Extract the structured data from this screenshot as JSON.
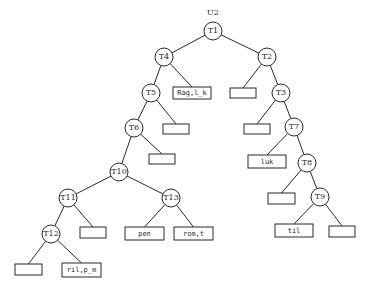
{
  "diagram": {
    "title": "U2",
    "root_label_pos": {
      "x": 213,
      "y": 8
    },
    "node_radius": 9,
    "nodes": [
      {
        "id": "T1",
        "label": "T1",
        "x": 213,
        "y": 31
      },
      {
        "id": "T4",
        "label": "T4",
        "x": 164,
        "y": 57
      },
      {
        "id": "T2",
        "label": "T2",
        "x": 267,
        "y": 57
      },
      {
        "id": "T5",
        "label": "T5",
        "x": 151,
        "y": 93
      },
      {
        "id": "T3",
        "label": "T3",
        "x": 281,
        "y": 93
      },
      {
        "id": "T6",
        "label": "T6",
        "x": 134,
        "y": 128
      },
      {
        "id": "T7",
        "label": "T7",
        "x": 294,
        "y": 127
      },
      {
        "id": "T10",
        "label": "T10",
        "x": 119,
        "y": 172
      },
      {
        "id": "T8",
        "label": "T8",
        "x": 307,
        "y": 163
      },
      {
        "id": "T11",
        "label": "T11",
        "x": 68,
        "y": 198
      },
      {
        "id": "T13",
        "label": "T13",
        "x": 171,
        "y": 198
      },
      {
        "id": "T9",
        "label": "T9",
        "x": 320,
        "y": 197
      },
      {
        "id": "T12",
        "label": "T12",
        "x": 51,
        "y": 234
      }
    ],
    "leaves": [
      {
        "id": "L_T4",
        "label": "Rag,l_k",
        "x": 173,
        "y": 87,
        "w": 38,
        "h": 12
      },
      {
        "id": "L_T2",
        "label": "",
        "x": 230,
        "y": 88,
        "w": 26,
        "h": 10
      },
      {
        "id": "L_T5",
        "label": "",
        "x": 163,
        "y": 124,
        "w": 26,
        "h": 10
      },
      {
        "id": "L_T3",
        "label": "",
        "x": 244,
        "y": 124,
        "w": 26,
        "h": 10
      },
      {
        "id": "L_T6",
        "label": "",
        "x": 149,
        "y": 154,
        "w": 26,
        "h": 10
      },
      {
        "id": "L_T7",
        "label": "luk",
        "x": 248,
        "y": 155,
        "w": 38,
        "h": 13
      },
      {
        "id": "L_T8",
        "label": "",
        "x": 268,
        "y": 193,
        "w": 27,
        "h": 11
      },
      {
        "id": "L_T11",
        "label": "",
        "x": 80,
        "y": 227,
        "w": 26,
        "h": 11
      },
      {
        "id": "L_T13a",
        "label": "pen",
        "x": 125,
        "y": 227,
        "w": 39,
        "h": 13
      },
      {
        "id": "L_T13b",
        "label": "rom,t",
        "x": 174,
        "y": 227,
        "w": 39,
        "h": 13
      },
      {
        "id": "L_T9a",
        "label": "til",
        "x": 275,
        "y": 224,
        "w": 38,
        "h": 13
      },
      {
        "id": "L_T9b",
        "label": "",
        "x": 329,
        "y": 226,
        "w": 26,
        "h": 11
      },
      {
        "id": "L_T12a",
        "label": "",
        "x": 15,
        "y": 264,
        "w": 27,
        "h": 11
      },
      {
        "id": "L_T12b",
        "label": "ril,p_m",
        "x": 62,
        "y": 263,
        "w": 39,
        "h": 14
      }
    ],
    "edges": [
      {
        "from": "T1",
        "to": "T4"
      },
      {
        "from": "T1",
        "to": "T2"
      },
      {
        "from": "T4",
        "to": "T5"
      },
      {
        "from": "T4",
        "to": "L_T4"
      },
      {
        "from": "T2",
        "to": "L_T2"
      },
      {
        "from": "T2",
        "to": "T3"
      },
      {
        "from": "T5",
        "to": "T6"
      },
      {
        "from": "T5",
        "to": "L_T5"
      },
      {
        "from": "T3",
        "to": "L_T3"
      },
      {
        "from": "T3",
        "to": "T7"
      },
      {
        "from": "T6",
        "to": "T10"
      },
      {
        "from": "T6",
        "to": "L_T6"
      },
      {
        "from": "T7",
        "to": "L_T7"
      },
      {
        "from": "T7",
        "to": "T8"
      },
      {
        "from": "T10",
        "to": "T11"
      },
      {
        "from": "T10",
        "to": "T13"
      },
      {
        "from": "T8",
        "to": "L_T8"
      },
      {
        "from": "T8",
        "to": "T9"
      },
      {
        "from": "T11",
        "to": "T12"
      },
      {
        "from": "T11",
        "to": "L_T11"
      },
      {
        "from": "T13",
        "to": "L_T13a"
      },
      {
        "from": "T13",
        "to": "L_T13b"
      },
      {
        "from": "T9",
        "to": "L_T9a"
      },
      {
        "from": "T9",
        "to": "L_T9b"
      },
      {
        "from": "T12",
        "to": "L_T12a"
      },
      {
        "from": "T12",
        "to": "L_T12b"
      }
    ],
    "colors": {
      "stroke": "#2a2a2a",
      "background": "#ffffff"
    }
  }
}
